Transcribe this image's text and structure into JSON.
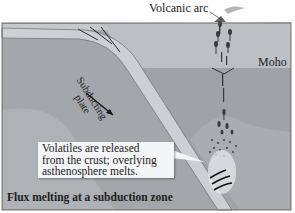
{
  "diagram": {
    "title": "Flux melting at a subduction zone",
    "labels": {
      "volcanic_arc": "Volcanic arc",
      "moho": "Moho",
      "subducting_plate_line1": "Subducting",
      "subducting_plate_line2": "plate"
    },
    "callout": {
      "line1": "Volatiles are released",
      "line2": "from the crust; overlying",
      "line3": "asthenosphere melts."
    },
    "colors": {
      "crust": "#b9bcc0",
      "mantle": "#9a9ea3",
      "lower_mantle": "#a7abaf",
      "slab": "#c9ccd0",
      "magma": "#3a3a3a",
      "callout_bg": "#f4f5f6"
    }
  }
}
